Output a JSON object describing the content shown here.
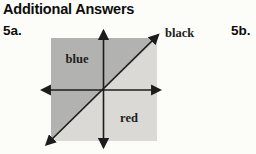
{
  "page": {
    "heading": "Additional Answers",
    "background_color": "#fcfcf8",
    "heading_color": "#0d0d0d"
  },
  "answers": {
    "item_a_label": "5a.",
    "item_b_label": "5b."
  },
  "figure": {
    "type": "coordinate-plane",
    "line_label": "black",
    "upper_region_label": "blue",
    "lower_region_label": "red",
    "upper_region_color": "#b2b2b0",
    "lower_region_color": "#dad9d5",
    "axis_color": "#1c1c1c",
    "label_color": "#1d1d1d"
  }
}
